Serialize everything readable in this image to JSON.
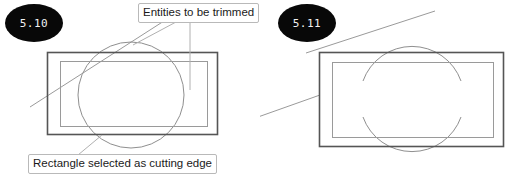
{
  "figure": {
    "panels": [
      {
        "id": "before",
        "badge": "5.10",
        "state": "before-trim",
        "callouts": [
          {
            "id": "entities",
            "text": "Entities to be trimmed"
          },
          {
            "id": "cutting-edge",
            "text": "Rectangle selected as cutting edge"
          }
        ]
      },
      {
        "id": "after",
        "badge": "5.11",
        "state": "after-trim",
        "callouts": []
      }
    ]
  },
  "colors": {
    "badge_fill": "#080808",
    "badge_text": "#f2f2f2",
    "callout_border": "#b9b9b9",
    "callout_fill": "#ffffff",
    "rect_outer_stroke": "#555555",
    "rect_inner_stroke": "#9a9a9a",
    "circle_stroke": "#8f8f8f",
    "diagonal_stroke": "#9a9a9a",
    "leader_stroke": "#b0b0b0",
    "page_background": "#ffffff"
  },
  "geometry": {
    "before": {
      "outer_rect": {
        "x": 47,
        "y": 52,
        "w": 171,
        "h": 83
      },
      "inner_rect": {
        "x": 60,
        "y": 61,
        "w": 148,
        "h": 66
      },
      "circle": {
        "cx": 131,
        "cy": 95,
        "r": 53
      },
      "diagonal": {
        "x1": 30,
        "y1": 107,
        "x2": 178,
        "y2": 12
      },
      "leader_entities_diagonal": {
        "x1": 176,
        "y1": 22,
        "x2": 133,
        "y2": 45
      },
      "leader_entities_vertical": {
        "x1": 190,
        "y1": 22,
        "x2": 190,
        "y2": 90
      },
      "leader_cutting_edge": {
        "x1": 78,
        "y1": 155,
        "x2": 102,
        "y2": 135
      }
    },
    "after": {
      "outer_rect": {
        "x": 59,
        "y": 52,
        "w": 185,
        "h": 95
      },
      "inner_rect": {
        "x": 72,
        "y": 62,
        "w": 162,
        "h": 76
      },
      "arc_top": {
        "cx": 152,
        "cy": 99,
        "r": 52,
        "start_deg": 200,
        "end_deg": 340
      },
      "arc_bottom": {
        "cx": 152,
        "cy": 99,
        "r": 52,
        "start_deg": 20,
        "end_deg": 160
      },
      "diagonal_upper": {
        "x1": 46,
        "y1": 52,
        "x2": 175,
        "y2": 11
      },
      "diagonal_lower": {
        "x1": 0,
        "y1": 93,
        "x2": 60,
        "y2": 93
      }
    }
  },
  "labels": {
    "entities_to_be_trimmed": "Entities to be trimmed",
    "rectangle_cutting_edge": "Rectangle selected as cutting edge",
    "badge_before": "5.10",
    "badge_after": "5.11"
  }
}
